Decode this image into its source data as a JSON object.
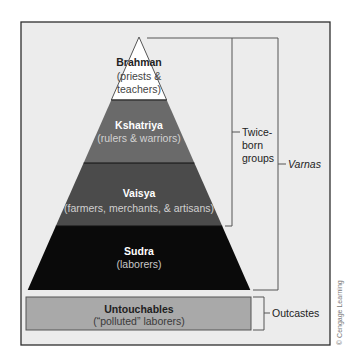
{
  "diagram": {
    "background_color": "#ececec",
    "tiers": [
      {
        "name": "Brahman",
        "description_lines": [
          "(priests &",
          "teachers)"
        ],
        "fill": "#ffffff",
        "text_color": "#222222",
        "sub_color": "#333333"
      },
      {
        "name": "Kshatriya",
        "description_lines": [
          "(rulers & warriors)"
        ],
        "fill": "#6a6a6a",
        "text_color": "#ffffff",
        "sub_color": "#d2d2d2"
      },
      {
        "name": "Vaisya",
        "description_lines": [
          "(farmers, merchants, & artisans)"
        ],
        "fill": "#4b4b4b",
        "text_color": "#ffffff",
        "sub_color": "#d0d0d0"
      },
      {
        "name": "Sudra",
        "description_lines": [
          "(laborers)"
        ],
        "fill": "#0a0a0a",
        "text_color": "#ffffff",
        "sub_color": "#c8c8c8"
      }
    ],
    "outcaste_box": {
      "name": "Untouchables",
      "description": "(“polluted” laborers)",
      "fill": "#a9a9a9"
    },
    "brackets": {
      "twice_born": {
        "label_lines": [
          "Twice-",
          "born",
          "groups"
        ]
      },
      "varnas": {
        "label": "Varnas"
      },
      "outcastes": {
        "label": "Outcastes"
      }
    },
    "credit": "© Cengage Learning"
  }
}
